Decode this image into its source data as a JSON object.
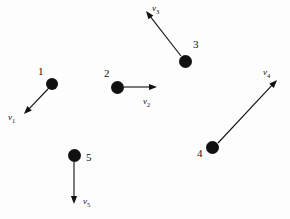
{
  "figure": {
    "type": "physics-vector-diagram",
    "background_color": "#fdfdfd",
    "ink_color": "#111111",
    "width": 290,
    "height": 219
  },
  "particles": [
    {
      "number": "1",
      "dot": {
        "cx": 52,
        "cy": 84,
        "r": 6
      },
      "number_pos": {
        "x": 38,
        "y": 66
      },
      "vector": {
        "label": "v",
        "subscript": "1",
        "start": {
          "x": 48,
          "y": 89
        },
        "end": {
          "x": 24,
          "y": 114
        },
        "label_pos": {
          "x": 8,
          "y": 113
        },
        "direction": "down-left"
      }
    },
    {
      "number": "2",
      "dot": {
        "cx": 117,
        "cy": 87,
        "r": 6.5
      },
      "number_pos": {
        "x": 104,
        "y": 68
      },
      "vector": {
        "label": "v",
        "subscript": "2",
        "start": {
          "x": 124,
          "y": 87
        },
        "end": {
          "x": 157,
          "y": 87
        },
        "label_pos": {
          "x": 143,
          "y": 97
        },
        "direction": "right"
      }
    },
    {
      "number": "3",
      "dot": {
        "cx": 185,
        "cy": 61,
        "r": 6.5
      },
      "number_pos": {
        "x": 193,
        "y": 39
      },
      "vector": {
        "label": "v",
        "subscript": "3",
        "start": {
          "x": 181,
          "y": 56
        },
        "end": {
          "x": 146,
          "y": 11
        },
        "label_pos": {
          "x": 152,
          "y": 4
        },
        "direction": "up-left"
      }
    },
    {
      "number": "4",
      "dot": {
        "cx": 212,
        "cy": 147,
        "r": 6.5
      },
      "number_pos": {
        "x": 197,
        "y": 148
      },
      "vector": {
        "label": "v",
        "subscript": "4",
        "start": {
          "x": 218,
          "y": 143
        },
        "end": {
          "x": 277,
          "y": 80
        },
        "label_pos": {
          "x": 263,
          "y": 68
        },
        "direction": "up-right"
      }
    },
    {
      "number": "5",
      "dot": {
        "cx": 74,
        "cy": 155,
        "r": 6.5
      },
      "number_pos": {
        "x": 86,
        "y": 152
      },
      "vector": {
        "label": "v",
        "subscript": "5",
        "start": {
          "x": 74,
          "y": 162
        },
        "end": {
          "x": 74,
          "y": 204
        },
        "label_pos": {
          "x": 83,
          "y": 197
        },
        "direction": "down"
      }
    }
  ]
}
